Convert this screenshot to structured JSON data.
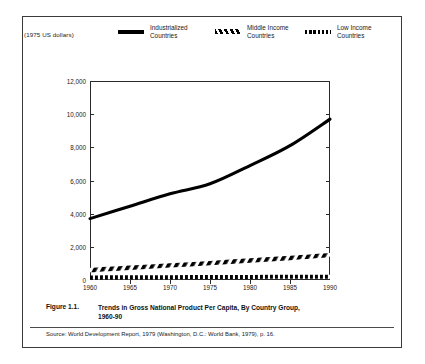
{
  "units_label": "(1975 US dollars)",
  "legend": {
    "items": [
      {
        "label": "Industrialized\nCountries",
        "style": "solid",
        "swatch_name": "legend-swatch-solid"
      },
      {
        "label": "Middle Income\nCountries",
        "style": "hatch",
        "swatch_name": "legend-swatch-hatched"
      },
      {
        "label": "Low Income\nCountries",
        "style": "dotted",
        "swatch_name": "legend-swatch-dotted"
      }
    ]
  },
  "caption": {
    "figure_number": "Figure 1.1.",
    "title": "Trends in Gross National Product Per Capita, By Country Group,\n1960-90"
  },
  "source": "Source: World Development Report, 1979 (Washington, D.C.: World Bank, 1979), p. 16.",
  "chart_data": {
    "type": "line",
    "title": "Trends in Gross National Product Per Capita, By Country Group, 1960-90",
    "xlabel": "",
    "ylabel": "(1975 US dollars)",
    "xlim": [
      1960,
      1990
    ],
    "ylim": [
      0,
      12000
    ],
    "grid": false,
    "legend_position": "top",
    "xticks": [
      "1960",
      "1965",
      "1970",
      "1975",
      "1980",
      "1985",
      "1990"
    ],
    "xtick_values": [
      1960,
      1965,
      1970,
      1975,
      1980,
      1985,
      1990
    ],
    "yticks": [
      "0",
      "2,000",
      "4,000",
      "6,000",
      "8,000",
      "10,000",
      "12,000"
    ],
    "ytick_values": [
      0,
      2000,
      4000,
      6000,
      8000,
      10000,
      12000
    ],
    "x": [
      1960,
      1965,
      1970,
      1975,
      1980,
      1985,
      1990
    ],
    "series": [
      {
        "name": "Industrialized Countries",
        "style": "solid",
        "color": "#000000",
        "values": [
          3700,
          4450,
          5200,
          5800,
          6900,
          8100,
          9700
        ]
      },
      {
        "name": "Middle Income Countries",
        "style": "hatched",
        "color": "#000000",
        "values": [
          600,
          740,
          880,
          1020,
          1180,
          1330,
          1500
        ]
      },
      {
        "name": "Low Income Countries",
        "style": "dotted",
        "color": "#000000",
        "values": [
          150,
          160,
          170,
          175,
          185,
          190,
          200
        ]
      }
    ]
  }
}
